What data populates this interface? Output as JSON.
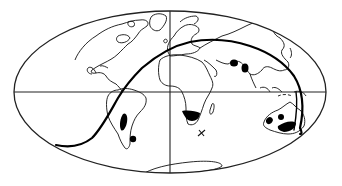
{
  "figure": {
    "projection": "equal-area elliptical world map",
    "graticule": [
      "equator",
      "central-meridian"
    ],
    "colors": {
      "background": "#ffffff",
      "line": "#111111",
      "fill": "#000000"
    },
    "track": {
      "description": "bold curved path from southeast Pacific across South America, Atlantic, Europe, Asia to Australia",
      "start_region": "South Pacific (west)",
      "end_region": "Australia (southeast)"
    },
    "filled_regions": [
      "Southern South America (Patagonia)",
      "Dot near southern tip of South America",
      "Southern Africa",
      "Central Asia (two spots)",
      "Western Australia",
      "Central Australia dot",
      "Southeastern Australia"
    ],
    "markers": [
      {
        "symbol": "+",
        "location": "Southern Indian Ocean"
      }
    ]
  }
}
